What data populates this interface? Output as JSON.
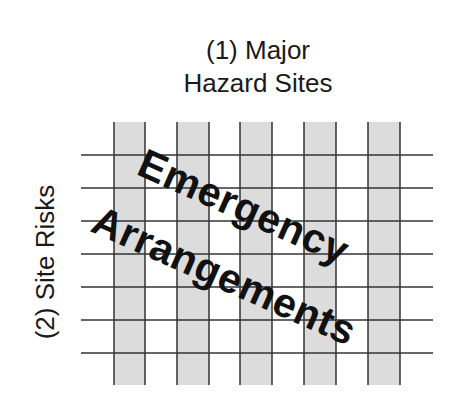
{
  "diagram": {
    "title_line1": "(1)  Major",
    "title_line2": "Hazard Sites",
    "side_label": "(2)  Site Risks",
    "overlay_line1": "Emergency",
    "overlay_line2": "Arrangements"
  },
  "grid": {
    "shaded_columns": [
      {
        "x": 114,
        "width": 31
      },
      {
        "x": 177,
        "width": 32
      },
      {
        "x": 240,
        "width": 32
      },
      {
        "x": 304,
        "width": 32
      },
      {
        "x": 368,
        "width": 32
      }
    ],
    "column_top": 122,
    "column_bottom": 385,
    "horizontal_lines_y": [
      155,
      188,
      221,
      254,
      287,
      320,
      353
    ],
    "horizontal_line_x_start": 81,
    "horizontal_line_x_end": 433,
    "colors": {
      "shade": "#dcdcdc",
      "line": "#333333",
      "text": "#111111"
    }
  }
}
